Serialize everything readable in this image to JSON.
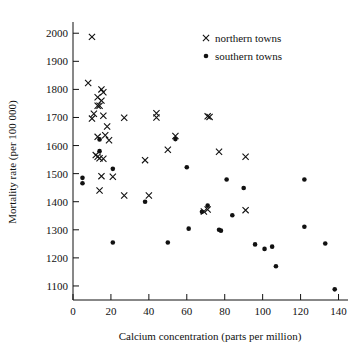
{
  "chart_data": {
    "type": "scatter",
    "title": "",
    "xlabel": "Calcium concentration (parts per million)",
    "ylabel": "Mortality rate (per 100 000)",
    "xlim": [
      0,
      145
    ],
    "ylim": [
      1050,
      2040
    ],
    "xticks": [
      0,
      20,
      40,
      60,
      80,
      100,
      120,
      140
    ],
    "yticks": [
      1100,
      1200,
      1300,
      1400,
      1500,
      1600,
      1700,
      1800,
      1900,
      2000
    ],
    "grid": false,
    "legend_position": "top-right",
    "series": [
      {
        "name": "northern towns",
        "marker": "x",
        "color": "#111111",
        "points": [
          [
            10,
            1987
          ],
          [
            8,
            1823
          ],
          [
            13,
            1742
          ],
          [
            11,
            1713
          ],
          [
            10,
            1696
          ],
          [
            13,
            1772
          ],
          [
            15,
            1800
          ],
          [
            16,
            1790
          ],
          [
            15,
            1760
          ],
          [
            14,
            1742
          ],
          [
            16,
            1706
          ],
          [
            18,
            1668
          ],
          [
            17,
            1637
          ],
          [
            13,
            1631
          ],
          [
            19,
            1619
          ],
          [
            12,
            1566
          ],
          [
            13,
            1560
          ],
          [
            14,
            1555
          ],
          [
            16,
            1553
          ],
          [
            27,
            1699
          ],
          [
            44,
            1715
          ],
          [
            44,
            1700
          ],
          [
            71,
            1704
          ],
          [
            72,
            1702
          ],
          [
            54,
            1634
          ],
          [
            50,
            1585
          ],
          [
            77,
            1578
          ],
          [
            91,
            1560
          ],
          [
            38,
            1548
          ],
          [
            21,
            1489
          ],
          [
            15,
            1491
          ],
          [
            27,
            1422
          ],
          [
            40,
            1422
          ],
          [
            14,
            1440
          ],
          [
            69,
            1365
          ],
          [
            71,
            1372
          ],
          [
            91,
            1370
          ]
        ]
      },
      {
        "name": "southern towns",
        "marker": "o",
        "color": "#111111",
        "points": [
          [
            5,
            1485
          ],
          [
            5,
            1466
          ],
          [
            14,
            1622
          ],
          [
            14,
            1580
          ],
          [
            21,
            1517
          ],
          [
            60,
            1523
          ],
          [
            54,
            1623
          ],
          [
            81,
            1479
          ],
          [
            90,
            1449
          ],
          [
            122,
            1479
          ],
          [
            71,
            1386
          ],
          [
            38,
            1400
          ],
          [
            84,
            1352
          ],
          [
            68,
            1364
          ],
          [
            77,
            1300
          ],
          [
            78,
            1297
          ],
          [
            61,
            1304
          ],
          [
            122,
            1311
          ],
          [
            21,
            1255
          ],
          [
            50,
            1255
          ],
          [
            96,
            1248
          ],
          [
            101,
            1232
          ],
          [
            105,
            1240
          ],
          [
            133,
            1251
          ],
          [
            107,
            1170
          ],
          [
            138,
            1088
          ]
        ]
      }
    ],
    "legend": [
      {
        "label": "northern towns",
        "marker": "x"
      },
      {
        "label": "southern towns",
        "marker": "o"
      }
    ]
  }
}
